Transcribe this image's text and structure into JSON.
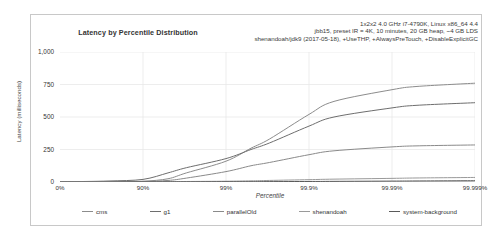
{
  "chart_data": {
    "type": "line",
    "title": "Latency by Percentile Distribution",
    "xlabel": "Percentile",
    "ylabel": "Latency (milliseconds)",
    "subtitle_lines": [
      "1x2x2 4.0 GHz i7-4790K, Linux x86_64 4.4",
      "jbb15, preset IR = 4K, 10 minutes, 20 GB heap, ~4 GB LDS",
      "shenandoah/jdk9 (2017-05-18), +UseTHP, +AlwaysPreTouch, +DisableExplicitGC"
    ],
    "ylim": [
      0,
      1000
    ],
    "yticks": [
      0,
      250,
      500,
      750,
      1000
    ],
    "ytick_labels": [
      "0",
      "250",
      "500",
      "750",
      "1,000"
    ],
    "xtick_labels": [
      "0%",
      "90%",
      "99%",
      "99.9%",
      "99.99%",
      "99.999%"
    ],
    "xtick_percentiles": [
      0,
      90,
      99,
      99.9,
      99.99,
      99.999
    ],
    "grid": true,
    "legend_position": "bottom",
    "series": [
      {
        "name": "cms",
        "color": "#8c8c8c",
        "x": [
          0,
          50,
          75,
          90,
          95,
          97,
          99,
          99.5,
          99.7,
          99.9,
          99.95,
          99.99,
          99.995,
          99.999
        ],
        "values": [
          2,
          3,
          4,
          6,
          25,
          70,
          160,
          260,
          330,
          520,
          620,
          710,
          735,
          760
        ]
      },
      {
        "name": "g1",
        "color": "#6e6e6e",
        "x": [
          0,
          50,
          75,
          90,
          95,
          97,
          99,
          99.5,
          99.7,
          99.9,
          99.95,
          99.99,
          99.995,
          99.999
        ],
        "values": [
          2,
          4,
          8,
          20,
          70,
          110,
          180,
          250,
          300,
          430,
          500,
          570,
          590,
          610
        ]
      },
      {
        "name": "parallelOld",
        "color": "#8a8a8a",
        "x": [
          0,
          50,
          75,
          90,
          95,
          97,
          99,
          99.5,
          99.7,
          99.9,
          99.95,
          99.99,
          99.995,
          99.999
        ],
        "values": [
          1,
          2,
          3,
          4,
          12,
          30,
          80,
          125,
          150,
          210,
          240,
          270,
          278,
          285
        ]
      },
      {
        "name": "shenandoah",
        "color": "#9a9a9a",
        "x": [
          0,
          50,
          75,
          90,
          95,
          97,
          99,
          99.5,
          99.7,
          99.9,
          99.95,
          99.99,
          99.995,
          99.999
        ],
        "values": [
          1,
          1,
          2,
          2,
          3,
          4,
          6,
          9,
          12,
          18,
          22,
          28,
          31,
          35
        ]
      },
      {
        "name": "system-background",
        "color": "#5a5a5a",
        "x": [
          0,
          50,
          75,
          90,
          95,
          97,
          99,
          99.5,
          99.7,
          99.9,
          99.95,
          99.99,
          99.995,
          99.999
        ],
        "values": [
          0,
          0,
          0,
          1,
          1,
          1,
          2,
          2,
          3,
          4,
          5,
          7,
          8,
          10
        ]
      }
    ]
  }
}
